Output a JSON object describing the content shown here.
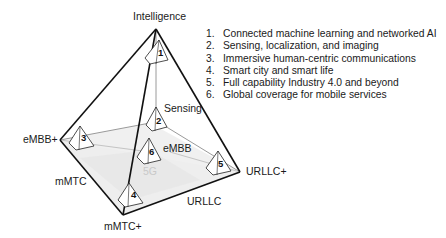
{
  "diagram": {
    "vertices": {
      "apex": "Intelligence",
      "left": "eMBB+",
      "bottom": "mMTC+",
      "right": "URLLC+"
    },
    "inner_labels": {
      "sensing": "Sensing",
      "embb": "eMBB",
      "mmtc": "mMTC",
      "urllc": "URLLC",
      "fiveg": "5G"
    },
    "markers": [
      "1",
      "2",
      "3",
      "4",
      "5",
      "6"
    ]
  },
  "legend": {
    "items": [
      {
        "num": "1.",
        "text": "Connected machine learning and networked AI"
      },
      {
        "num": "2.",
        "text": "Sensing, localization, and imaging"
      },
      {
        "num": "3.",
        "text": "Immersive human-centric communications"
      },
      {
        "num": "4.",
        "text": "Smart city and smart life"
      },
      {
        "num": "5.",
        "text": "Full capability Industry 4.0 and beyond"
      },
      {
        "num": "6.",
        "text": "Global coverage for mobile services"
      }
    ]
  },
  "colors": {
    "edge": "#111111",
    "inner_line": "#9a9a9a",
    "plane_fill": "#ececec",
    "label_5g": "#c8c8c8"
  }
}
